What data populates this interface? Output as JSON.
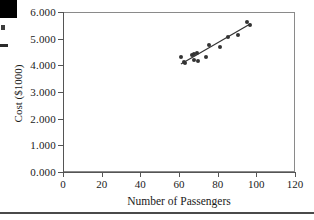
{
  "chart_data": {
    "type": "scatter",
    "title": "",
    "xlabel": "Number of Passengers",
    "ylabel": "Cost ($1000)",
    "xlim": [
      0,
      120
    ],
    "ylim": [
      0,
      6.0
    ],
    "grid": false,
    "legend": null,
    "x_ticks": [
      "0",
      "20",
      "40",
      "60",
      "80",
      "100",
      "120"
    ],
    "x_tick_values": [
      0,
      20,
      40,
      60,
      80,
      100,
      120
    ],
    "y_ticks": [
      "0.000",
      "1.000",
      "2.000",
      "3.000",
      "4.000",
      "5.000",
      "6.000"
    ],
    "y_tick_values": [
      0,
      1,
      2,
      3,
      4,
      5,
      6
    ],
    "marker_color": "#333333",
    "line_color": "#333333",
    "frame_color": "#8a8a8a",
    "points": [
      {
        "x": 61.0,
        "y": 4.3
      },
      {
        "x": 62.5,
        "y": 4.12
      },
      {
        "x": 63.0,
        "y": 4.08
      },
      {
        "x": 66.5,
        "y": 4.38
      },
      {
        "x": 67.5,
        "y": 4.42
      },
      {
        "x": 68.0,
        "y": 4.2
      },
      {
        "x": 69.5,
        "y": 4.48
      },
      {
        "x": 70.0,
        "y": 4.17
      },
      {
        "x": 74.0,
        "y": 4.3
      },
      {
        "x": 75.5,
        "y": 4.78
      },
      {
        "x": 81.0,
        "y": 4.7
      },
      {
        "x": 85.5,
        "y": 5.08
      },
      {
        "x": 90.5,
        "y": 5.12
      },
      {
        "x": 95.0,
        "y": 5.62
      },
      {
        "x": 96.5,
        "y": 5.52
      }
    ],
    "fit_line": {
      "type": "linear-regression",
      "x_start": 61.0,
      "y_start": 4.05,
      "x_end": 97.0,
      "y_end": 5.56
    }
  }
}
